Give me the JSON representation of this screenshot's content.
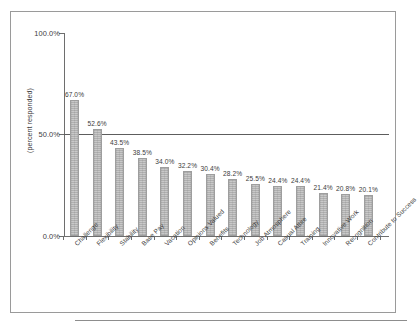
{
  "chart_data": {
    "type": "bar",
    "title": "",
    "subtitle": "",
    "xlabel": "",
    "ylabel": "(percent responded)",
    "ylim": [
      0,
      100
    ],
    "ytick_labels": [
      "100.0%",
      "50.0%",
      "0.0%"
    ],
    "ytick_values": [
      100,
      50,
      0
    ],
    "grid": false,
    "legend": null,
    "annotations": [
      {
        "type": "reference-line",
        "orientation": "horizontal",
        "value": 50
      }
    ],
    "categories": [
      "Challenge",
      "Flexibility",
      "Stability",
      "Base Pay",
      "Vacation",
      "Opinions Valued",
      "Benefits",
      "Technology",
      "Job Atmosphere",
      "Casual Attire",
      "Training",
      "Innovative Work",
      "Recognition",
      "Contribute to Success"
    ],
    "values": [
      67.0,
      52.6,
      43.5,
      38.5,
      34.0,
      32.2,
      30.4,
      28.2,
      25.5,
      24.4,
      24.4,
      21.4,
      20.8,
      20.1
    ],
    "data_labels": [
      "67.0%",
      "52.6%",
      "43.5%",
      "38.5%",
      "34.0%",
      "32.2%",
      "30.4%",
      "28.2%",
      "25.5%",
      "24.4%",
      "24.4%",
      "21.4%",
      "20.8%",
      "20.1%"
    ],
    "colors": {
      "bar_fill": "#c9c9c9",
      "bar_border": "#9e9e9e",
      "axis": "#6e6e6e",
      "reference_line": "#5d5d5d",
      "frame": "#9a9a9a",
      "text": "#3b3b3b",
      "background": "#ffffff"
    }
  }
}
